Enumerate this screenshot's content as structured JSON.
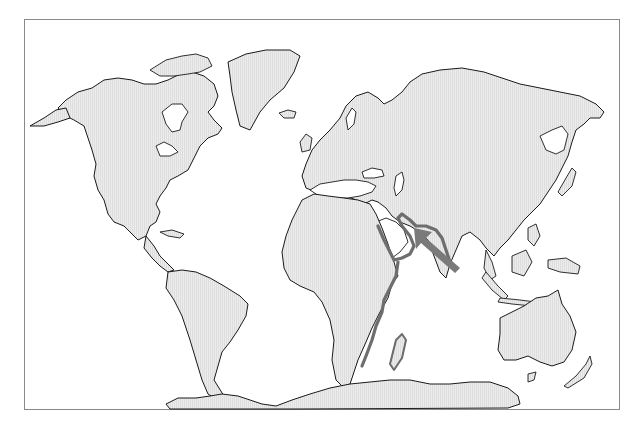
{
  "map": {
    "projection": "world",
    "land_fill": "#e9e9e9",
    "ocean_fill": "#ffffff",
    "coast_stroke": "#1a1a1a",
    "frame_stroke": "#8a8a8a",
    "highlight": {
      "region": "Arabian Peninsula and East African coast",
      "stroke_color": "#6e6e6e"
    },
    "arrow": {
      "color": "#7a7a7a",
      "direction": "pointing north-west toward Gulf of Aden / Arabian Sea",
      "from": [
        455,
        270
      ],
      "to": [
        415,
        228
      ]
    },
    "continents": [
      "North America",
      "Greenland",
      "South America",
      "Europe",
      "Africa",
      "Asia",
      "Australia",
      "New Zealand",
      "Antarctica",
      "Madagascar"
    ]
  }
}
